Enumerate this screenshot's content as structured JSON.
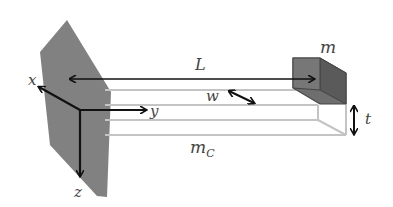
{
  "diagram": {
    "labels": {
      "length": "L",
      "tip_mass": "m",
      "width": "w",
      "thickness": "t",
      "beam_mass": "m",
      "beam_mass_sub": "C",
      "axis_x": "x",
      "axis_y": "y",
      "axis_z": "z"
    },
    "colors": {
      "wall": "#7a7a7a",
      "mass_front": "#6e6e6e",
      "mass_side": "#5a5a5a",
      "beam_edge": "#c4c4c4",
      "arrow": "#111111",
      "label": "#444444"
    }
  }
}
